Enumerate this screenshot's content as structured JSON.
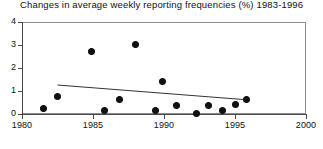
{
  "chart_data": {
    "type": "scatter",
    "title": "Changes in average weekly reporting frequencies (%) 1983-1996",
    "xlabel": "",
    "ylabel": "",
    "xlim": [
      1980,
      2000
    ],
    "ylim": [
      0,
      4
    ],
    "grid": false,
    "legend": "none",
    "xticks": [
      1980,
      1985,
      1990,
      1995,
      2000
    ],
    "xtick_labels": [
      "1980",
      "1985",
      "1990",
      "1995",
      "2000"
    ],
    "yticks": [
      0,
      1,
      2,
      3,
      4
    ],
    "ytick_labels": [
      "0",
      "1",
      "2",
      "3",
      "4"
    ],
    "points": [
      {
        "x": 1981.5,
        "y": 0.26
      },
      {
        "x": 1982.5,
        "y": 0.78
      },
      {
        "x": 1984.9,
        "y": 2.7
      },
      {
        "x": 1985.8,
        "y": 0.17
      },
      {
        "x": 1986.9,
        "y": 0.65
      },
      {
        "x": 1988.0,
        "y": 3.04
      },
      {
        "x": 1989.4,
        "y": 0.17
      },
      {
        "x": 1989.9,
        "y": 1.43
      },
      {
        "x": 1990.9,
        "y": 0.35
      },
      {
        "x": 1992.3,
        "y": 0.04
      },
      {
        "x": 1993.1,
        "y": 0.39
      },
      {
        "x": 1994.1,
        "y": 0.17
      },
      {
        "x": 1995.0,
        "y": 0.43
      },
      {
        "x": 1995.8,
        "y": 0.61
      }
    ],
    "trendline": {
      "x": [
        1982.5,
        1996.0
      ],
      "y": [
        1.26,
        0.61
      ]
    },
    "marker_color": "#111111",
    "line_color": "#333333",
    "axis_color": "#4a4a4a",
    "frame_color": "#8d8d8d"
  }
}
